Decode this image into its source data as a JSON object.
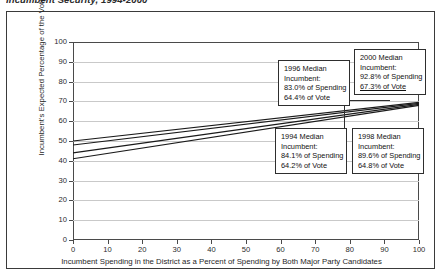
{
  "page": {
    "title": "Incumbent Security, 1994-2000"
  },
  "chart_data": {
    "type": "line",
    "title": "",
    "xlabel": "Incumbent Spending in the District as a Percent of Spending by Both Major Party Candidates",
    "ylabel": "Incumbent's Expected Percentage of the Vote",
    "xlim": [
      0,
      100
    ],
    "ylim": [
      0,
      100
    ],
    "xticks": [
      0,
      10,
      20,
      30,
      40,
      50,
      60,
      70,
      80,
      90,
      100
    ],
    "yticks": [
      0,
      10,
      20,
      30,
      40,
      50,
      60,
      70,
      80,
      90,
      100
    ],
    "grid": true,
    "legend": "none",
    "x": [
      0,
      100
    ],
    "series": [
      {
        "name": "1994",
        "values": [
          44.0,
          68.5
        ]
      },
      {
        "name": "1996",
        "values": [
          48.0,
          69.0
        ]
      },
      {
        "name": "1998",
        "values": [
          41.0,
          68.0
        ]
      },
      {
        "name": "2000",
        "values": [
          50.0,
          69.5
        ]
      }
    ],
    "annotations": [
      {
        "id": "1996",
        "line1": "1996 Median",
        "line2": "Incumbent:",
        "line3": "83.0% of Spending",
        "line4": "64.4% of Vote",
        "underline4": false
      },
      {
        "id": "2000",
        "line1": "2000 Median",
        "line2": "Incumbent:",
        "line3": "92.8% of Spending",
        "line4": "67.3% of Vote",
        "underline4": true
      },
      {
        "id": "1994",
        "line1": "1994 Median",
        "line2": "Incumbent:",
        "line3": "84.1% of Spending",
        "line4": "64.2% of Vote",
        "underline4": false
      },
      {
        "id": "1998",
        "line1": "1998 Median",
        "line2": "Incumbent:",
        "line3": "89.6% of Spending",
        "line4": "64.8% of Vote",
        "underline4": false
      }
    ],
    "colors": {
      "line": "#1a1a1a",
      "grid": "#c9c9c9",
      "axis": "#4a4a4a",
      "background": "#ffffff"
    }
  },
  "axis": {
    "yticks": [
      "0",
      "10",
      "20",
      "30",
      "40",
      "50",
      "60",
      "70",
      "80",
      "90",
      "100"
    ],
    "xticks": [
      "0",
      "10",
      "20",
      "30",
      "40",
      "50",
      "60",
      "70",
      "80",
      "90",
      "100"
    ]
  }
}
